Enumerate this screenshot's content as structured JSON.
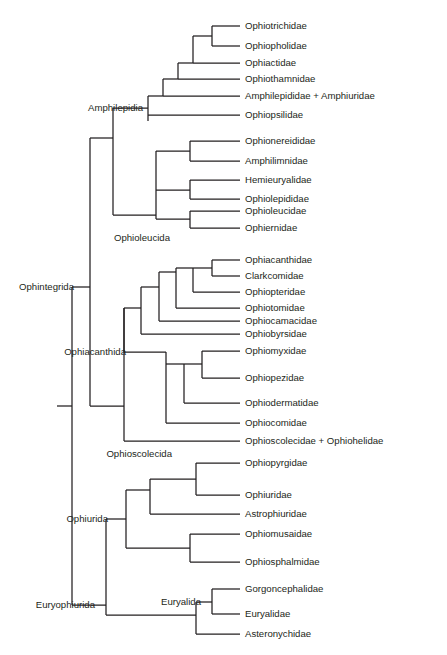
{
  "figure": {
    "type": "phylogenetic-tree",
    "orientation": "left-to-right-rectangular-cladogram",
    "background_color": "#ffffff",
    "line_color": "#231f20",
    "text_color": "#231f20"
  },
  "chart_data": {
    "type": "table",
    "title": "",
    "xlabel": "",
    "ylabel": "",
    "leaves": [
      {
        "id": "ophiotrichidae",
        "label": "Ophiotrichidae",
        "x": 240,
        "y": 26
      },
      {
        "id": "ophiopholidae",
        "label": "Ophiopholidae",
        "x": 240,
        "y": 46
      },
      {
        "id": "ophiactidae",
        "label": "Ophiactidae",
        "x": 240,
        "y": 63
      },
      {
        "id": "ophiothamnidae",
        "label": "Ophiothamnidae",
        "x": 240,
        "y": 79
      },
      {
        "id": "amphilepididae",
        "label": "Amphilepididae + Amphiuridae",
        "x": 240,
        "y": 96
      },
      {
        "id": "ophiopsilidae",
        "label": "Ophiopsilidae",
        "x": 240,
        "y": 115
      },
      {
        "id": "ophionereididae",
        "label": "Ophionereididae",
        "x": 240,
        "y": 141
      },
      {
        "id": "amphilimnidae",
        "label": "Amphilimnidae",
        "x": 240,
        "y": 161
      },
      {
        "id": "hemieuryalidae",
        "label": "Hemieuryalidae",
        "x": 240,
        "y": 180
      },
      {
        "id": "ophiolepididae",
        "label": "Ophiolepididae",
        "x": 240,
        "y": 199
      },
      {
        "id": "ophioleucidae",
        "label": "Ophioleucidae",
        "x": 240,
        "y": 211
      },
      {
        "id": "ophiernidae",
        "label": "Ophiernidae",
        "x": 240,
        "y": 228
      },
      {
        "id": "ophiacanthidae",
        "label": "Ophiacanthidae",
        "x": 240,
        "y": 260
      },
      {
        "id": "clarkcomidae",
        "label": "Clarkcomidae",
        "x": 240,
        "y": 276
      },
      {
        "id": "ophiopteridae",
        "label": "Ophiopteridae",
        "x": 240,
        "y": 292
      },
      {
        "id": "ophiotomidae",
        "label": "Ophiotomidae",
        "x": 240,
        "y": 308
      },
      {
        "id": "ophiocamacidae",
        "label": "Ophiocamacidae",
        "x": 240,
        "y": 321
      },
      {
        "id": "ophiobyrsidae",
        "label": "Ophiobyrsidae",
        "x": 240,
        "y": 334
      },
      {
        "id": "ophiomyxidae",
        "label": "Ophiomyxidae",
        "x": 240,
        "y": 351
      },
      {
        "id": "ophiopezidae",
        "label": "Ophiopezidae",
        "x": 240,
        "y": 378
      },
      {
        "id": "ophiodermatidae",
        "label": "Ophiodermatidae",
        "x": 240,
        "y": 403
      },
      {
        "id": "ophiocomidae",
        "label": "Ophiocomidae",
        "x": 240,
        "y": 423
      },
      {
        "id": "ophioscolecidae",
        "label": "Ophioscolecidae + Ophiohelidae",
        "x": 240,
        "y": 441
      },
      {
        "id": "ophiopyrgidae",
        "label": "Ophiopyrgidae",
        "x": 240,
        "y": 463
      },
      {
        "id": "ophiuridae",
        "label": "Ophiuridae",
        "x": 240,
        "y": 495
      },
      {
        "id": "astrophiuridae",
        "label": "Astrophiuridae",
        "x": 240,
        "y": 514
      },
      {
        "id": "ophiomusaidae",
        "label": "Ophiomusaidae",
        "x": 240,
        "y": 534
      },
      {
        "id": "ophiosphalmidae",
        "label": "Ophiosphalmidae",
        "x": 240,
        "y": 562
      },
      {
        "id": "gorgoncephalidae",
        "label": "Gorgoncephalidae",
        "x": 240,
        "y": 589
      },
      {
        "id": "euryalidae",
        "label": "Euryalidae",
        "x": 240,
        "y": 614
      },
      {
        "id": "asteronychidae",
        "label": "Asteronychidae",
        "x": 240,
        "y": 634
      }
    ],
    "clade_labels": [
      {
        "id": "ophintegrida",
        "label": "Ophintegrida",
        "x": 74,
        "y": 287
      },
      {
        "id": "amphilepidia",
        "label": "Amphilepidia",
        "x": 143,
        "y": 108
      },
      {
        "id": "ophioleucida",
        "label": "Ophioleucida",
        "x": 170,
        "y": 238
      },
      {
        "id": "ophiacanthida",
        "label": "Ophiacanthida",
        "x": 126,
        "y": 352
      },
      {
        "id": "ophioscolecida",
        "label": "Ophioscolecida",
        "x": 172,
        "y": 454
      },
      {
        "id": "ophiurida",
        "label": "Ophiurida",
        "x": 108,
        "y": 519
      },
      {
        "id": "euryophiurida",
        "label": "Euryophiurida",
        "x": 95,
        "y": 605
      },
      {
        "id": "euryalida",
        "label": "Euryalida",
        "x": 201,
        "y": 602
      }
    ],
    "branches": [
      {
        "id": "root-stem",
        "x1": 57,
        "y1": 406,
        "x2": 72,
        "y2": 406
      },
      {
        "id": "root-vertical",
        "x1": 72,
        "y1": 287,
        "x2": 72,
        "y2": 605
      },
      {
        "id": "ophintegrida-stem",
        "x1": 72,
        "y1": 287,
        "x2": 90,
        "y2": 287
      },
      {
        "id": "ophintegrida-vert",
        "x1": 90,
        "y1": 138,
        "x2": 90,
        "y2": 406
      },
      {
        "id": "amphilepidia-stem",
        "x1": 90,
        "y1": 138,
        "x2": 113,
        "y2": 138
      },
      {
        "id": "amph-ophil-vert",
        "x1": 113,
        "y1": 108,
        "x2": 113,
        "y2": 215
      },
      {
        "id": "amphilepidia-up",
        "x1": 113,
        "y1": 108,
        "x2": 148,
        "y2": 108
      },
      {
        "id": "amph-clade-vert",
        "x1": 148,
        "y1": 96,
        "x2": 148,
        "y2": 121
      },
      {
        "id": "amph-ophiopsil",
        "x1": 148,
        "y1": 115,
        "x2": 240,
        "y2": 115
      },
      {
        "id": "amph-upper-stem",
        "x1": 148,
        "y1": 96,
        "x2": 163,
        "y2": 96
      },
      {
        "id": "amph-upper-vert",
        "x1": 163,
        "y1": 79,
        "x2": 163,
        "y2": 96
      },
      {
        "id": "amph-amphilep-leaf",
        "x1": 163,
        "y1": 96,
        "x2": 240,
        "y2": 96
      },
      {
        "id": "ladder1-stem",
        "x1": 163,
        "y1": 79,
        "x2": 178,
        "y2": 79
      },
      {
        "id": "ladder1-vert",
        "x1": 178,
        "y1": 63,
        "x2": 178,
        "y2": 79
      },
      {
        "id": "ladder1-thamn",
        "x1": 178,
        "y1": 79,
        "x2": 240,
        "y2": 79
      },
      {
        "id": "ladder2-stem",
        "x1": 178,
        "y1": 63,
        "x2": 193,
        "y2": 63
      },
      {
        "id": "ladder2-vert",
        "x1": 193,
        "y1": 36,
        "x2": 193,
        "y2": 63
      },
      {
        "id": "ladder2-ophiact",
        "x1": 193,
        "y1": 63,
        "x2": 240,
        "y2": 63
      },
      {
        "id": "ladder3-stem",
        "x1": 193,
        "y1": 36,
        "x2": 212,
        "y2": 36
      },
      {
        "id": "ladder3-vert",
        "x1": 212,
        "y1": 26,
        "x2": 212,
        "y2": 46
      },
      {
        "id": "ladder3-trich",
        "x1": 212,
        "y1": 26,
        "x2": 240,
        "y2": 26
      },
      {
        "id": "ladder3-phol",
        "x1": 212,
        "y1": 46,
        "x2": 240,
        "y2": 46
      },
      {
        "id": "ophioleucida-stem",
        "x1": 113,
        "y1": 215,
        "x2": 156,
        "y2": 215
      },
      {
        "id": "ophioleu-vert",
        "x1": 156,
        "y1": 151,
        "x2": 156,
        "y2": 215
      },
      {
        "id": "ophioleu-grp3",
        "x1": 156,
        "y1": 219,
        "x2": 190,
        "y2": 219
      },
      {
        "id": "ophioleu-grp3-v",
        "x1": 190,
        "y1": 211,
        "x2": 190,
        "y2": 228
      },
      {
        "id": "ophioleu-leucidae",
        "x1": 190,
        "y1": 211,
        "x2": 240,
        "y2": 211
      },
      {
        "id": "ophioleu-ernidae",
        "x1": 190,
        "y1": 228,
        "x2": 240,
        "y2": 228
      },
      {
        "id": "ophioleu-grp2",
        "x1": 156,
        "y1": 190,
        "x2": 190,
        "y2": 190
      },
      {
        "id": "ophioleu-grp2-v",
        "x1": 190,
        "y1": 180,
        "x2": 190,
        "y2": 199
      },
      {
        "id": "ophioleu-hemi",
        "x1": 190,
        "y1": 180,
        "x2": 240,
        "y2": 180
      },
      {
        "id": "ophioleu-lepid",
        "x1": 190,
        "y1": 199,
        "x2": 240,
        "y2": 199
      },
      {
        "id": "ophioleu-grp1",
        "x1": 156,
        "y1": 151,
        "x2": 190,
        "y2": 151
      },
      {
        "id": "ophioleu-grp1-v",
        "x1": 190,
        "y1": 141,
        "x2": 190,
        "y2": 161
      },
      {
        "id": "ophioleu-nereid",
        "x1": 190,
        "y1": 141,
        "x2": 240,
        "y2": 141
      },
      {
        "id": "ophioleu-amphilim",
        "x1": 190,
        "y1": 161,
        "x2": 240,
        "y2": 161
      },
      {
        "id": "ophioleu-outer-v",
        "x1": 156,
        "y1": 215,
        "x2": 156,
        "y2": 219
      },
      {
        "id": "ophiacanth-stem",
        "x1": 90,
        "y1": 406,
        "x2": 124,
        "y2": 406
      },
      {
        "id": "ophiacanth-vert",
        "x1": 124,
        "y1": 308,
        "x2": 124,
        "y2": 441
      },
      {
        "id": "ophiosco-leaf",
        "x1": 124,
        "y1": 441,
        "x2": 240,
        "y2": 441
      },
      {
        "id": "ophiacanth-main-v",
        "x1": 124,
        "y1": 308,
        "x2": 124,
        "y2": 352
      },
      {
        "id": "oa-upper-stem",
        "x1": 124,
        "y1": 308,
        "x2": 141,
        "y2": 308
      },
      {
        "id": "oa-upper-vert",
        "x1": 141,
        "y1": 287,
        "x2": 141,
        "y2": 334
      },
      {
        "id": "oa-byrs",
        "x1": 141,
        "y1": 334,
        "x2": 240,
        "y2": 334
      },
      {
        "id": "oa-camac-stem",
        "x1": 141,
        "y1": 287,
        "x2": 159,
        "y2": 287
      },
      {
        "id": "oa-camac-vert",
        "x1": 159,
        "y1": 272,
        "x2": 159,
        "y2": 321
      },
      {
        "id": "oa-camac-leaf",
        "x1": 159,
        "y1": 321,
        "x2": 240,
        "y2": 321
      },
      {
        "id": "oa-tom-stem",
        "x1": 159,
        "y1": 272,
        "x2": 176,
        "y2": 272
      },
      {
        "id": "oa-tom-vert",
        "x1": 176,
        "y1": 268,
        "x2": 176,
        "y2": 308
      },
      {
        "id": "oa-tom-leaf",
        "x1": 176,
        "y1": 308,
        "x2": 240,
        "y2": 308
      },
      {
        "id": "oa-pter-stem",
        "x1": 176,
        "y1": 268,
        "x2": 193,
        "y2": 268
      },
      {
        "id": "oa-pter-vert",
        "x1": 193,
        "y1": 268,
        "x2": 193,
        "y2": 292
      },
      {
        "id": "oa-pter-leaf",
        "x1": 193,
        "y1": 292,
        "x2": 240,
        "y2": 292
      },
      {
        "id": "oa-acanth-stem",
        "x1": 193,
        "y1": 268,
        "x2": 212,
        "y2": 268
      },
      {
        "id": "oa-acanth-vert",
        "x1": 212,
        "y1": 260,
        "x2": 212,
        "y2": 276
      },
      {
        "id": "oa-acanth-leaf",
        "x1": 212,
        "y1": 260,
        "x2": 240,
        "y2": 260
      },
      {
        "id": "oa-clark-leaf",
        "x1": 212,
        "y1": 276,
        "x2": 240,
        "y2": 276
      },
      {
        "id": "oa-lower-stem",
        "x1": 124,
        "y1": 352,
        "x2": 166,
        "y2": 352
      },
      {
        "id": "oa-lower-vert",
        "x1": 166,
        "y1": 364,
        "x2": 166,
        "y2": 423
      },
      {
        "id": "oa-lower-top-v",
        "x1": 166,
        "y1": 352,
        "x2": 166,
        "y2": 364
      },
      {
        "id": "oa-ophiocom",
        "x1": 166,
        "y1": 423,
        "x2": 240,
        "y2": 423
      },
      {
        "id": "oa-derm-stem",
        "x1": 166,
        "y1": 364,
        "x2": 184,
        "y2": 364
      },
      {
        "id": "oa-derm-vert",
        "x1": 184,
        "y1": 364,
        "x2": 184,
        "y2": 403
      },
      {
        "id": "oa-derm-leaf",
        "x1": 184,
        "y1": 403,
        "x2": 240,
        "y2": 403
      },
      {
        "id": "oa-myx-stem",
        "x1": 184,
        "y1": 364,
        "x2": 202,
        "y2": 364
      },
      {
        "id": "oa-myx-vert",
        "x1": 202,
        "y1": 351,
        "x2": 202,
        "y2": 378
      },
      {
        "id": "oa-myx-leaf",
        "x1": 202,
        "y1": 351,
        "x2": 240,
        "y2": 351
      },
      {
        "id": "oa-pez-leaf",
        "x1": 202,
        "y1": 378,
        "x2": 240,
        "y2": 378
      },
      {
        "id": "euryo-stem",
        "x1": 72,
        "y1": 605,
        "x2": 106,
        "y2": 605
      },
      {
        "id": "euryo-vert",
        "x1": 106,
        "y1": 519,
        "x2": 106,
        "y2": 615
      },
      {
        "id": "ophiurida-stem",
        "x1": 106,
        "y1": 519,
        "x2": 106,
        "y2": 519
      },
      {
        "id": "ophiurida-out",
        "x1": 106,
        "y1": 519,
        "x2": 126,
        "y2": 519
      },
      {
        "id": "ophiurida-vert",
        "x1": 126,
        "y1": 490,
        "x2": 126,
        "y2": 548
      },
      {
        "id": "ophiu-sphal-stem",
        "x1": 126,
        "y1": 548,
        "x2": 190,
        "y2": 548
      },
      {
        "id": "ophiu-sphal-vert",
        "x1": 190,
        "y1": 534,
        "x2": 190,
        "y2": 562
      },
      {
        "id": "ophiu-musa-leaf",
        "x1": 190,
        "y1": 534,
        "x2": 240,
        "y2": 534
      },
      {
        "id": "ophiu-sphal-leaf",
        "x1": 190,
        "y1": 562,
        "x2": 240,
        "y2": 562
      },
      {
        "id": "ophiu-upper-stem",
        "x1": 126,
        "y1": 490,
        "x2": 150,
        "y2": 490
      },
      {
        "id": "ophiu-upper-vert",
        "x1": 150,
        "y1": 479,
        "x2": 150,
        "y2": 514
      },
      {
        "id": "ophiu-astro-leaf",
        "x1": 150,
        "y1": 514,
        "x2": 240,
        "y2": 514
      },
      {
        "id": "ophiu-pyrg-stem",
        "x1": 150,
        "y1": 479,
        "x2": 196,
        "y2": 479
      },
      {
        "id": "ophiu-pyrg-vert",
        "x1": 196,
        "y1": 463,
        "x2": 196,
        "y2": 495
      },
      {
        "id": "ophiu-pyrg-leaf",
        "x1": 196,
        "y1": 463,
        "x2": 240,
        "y2": 463
      },
      {
        "id": "ophiu-uridae-leaf",
        "x1": 196,
        "y1": 495,
        "x2": 240,
        "y2": 495
      },
      {
        "id": "euryalida-stem",
        "x1": 106,
        "y1": 615,
        "x2": 196,
        "y2": 615
      },
      {
        "id": "euryalida-vert",
        "x1": 196,
        "y1": 602,
        "x2": 196,
        "y2": 634
      },
      {
        "id": "eury-astero-leaf",
        "x1": 196,
        "y1": 634,
        "x2": 240,
        "y2": 634
      },
      {
        "id": "eury-upper-stem",
        "x1": 196,
        "y1": 602,
        "x2": 212,
        "y2": 602
      },
      {
        "id": "eury-upper-vert",
        "x1": 212,
        "y1": 589,
        "x2": 212,
        "y2": 614
      },
      {
        "id": "eury-gorgon-leaf",
        "x1": 212,
        "y1": 589,
        "x2": 240,
        "y2": 589
      },
      {
        "id": "eury-euryal-leaf",
        "x1": 212,
        "y1": 614,
        "x2": 240,
        "y2": 614
      }
    ]
  }
}
